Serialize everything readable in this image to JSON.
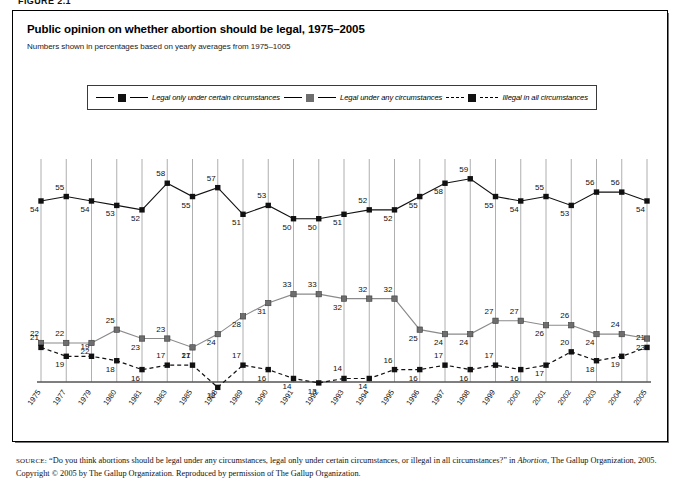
{
  "figure_tag": "FIGURE 2.1",
  "title": "Public opinion on whether abortion should be legal, 1975–2005",
  "subtitle": "Numbers shown in percentages based on yearly averages from 1975–1005",
  "legend": {
    "items": [
      {
        "label": "Legal only under certain circumstances",
        "marker": "dark-square-marker",
        "line": "solid",
        "color": "#111111"
      },
      {
        "label": "Legal under any circumstances",
        "marker": "gray-square-marker",
        "line": "solid",
        "color": "#6e6e6e"
      },
      {
        "label": "Illegal in all circumstances",
        "marker": "dark-square-marker",
        "line": "dashed",
        "color": "#111111"
      }
    ]
  },
  "source": {
    "label": "SOURCE:",
    "line1": "“Do you think abortions should be legal under any circumstances, legal only under certain circumstances, or illegal in all circumstances?” in",
    "italic": "Abortion",
    "line2": ", The Gallup Organization, 2005. Copyright © 2005 by The Gallup Organization. Reproduced by permission of The Gallup Organization."
  },
  "chart_data": {
    "type": "line",
    "title": "Public opinion on whether abortion should be legal, 1975–2005",
    "subtitle": "Numbers shown in percentages based on yearly averages from 1975–1005",
    "xlabel": "",
    "ylabel": "",
    "ylim": [
      0,
      65
    ],
    "grid": "vertical",
    "legend_position": "top",
    "categories": [
      "1975",
      "1977",
      "1979",
      "1980",
      "1981",
      "1983",
      "1985",
      "1988",
      "1989",
      "1990",
      "1991",
      "1992",
      "1993",
      "1994",
      "1995",
      "1996",
      "1997",
      "1998",
      "1999",
      "2000",
      "2001",
      "2002",
      "2003",
      "2004",
      "2005"
    ],
    "series": [
      {
        "name": "Legal only under certain circumstances",
        "color": "#111111",
        "style": "solid",
        "values": [
          54,
          55,
          54,
          53,
          52,
          58,
          55,
          57,
          51,
          53,
          50,
          50,
          51,
          52,
          52,
          55,
          58,
          59,
          55,
          54,
          55,
          53,
          56,
          56,
          54
        ]
      },
      {
        "name": "Legal under any circumstances",
        "color": "#6e6e6e",
        "style": "solid",
        "values": [
          22,
          22,
          22,
          25,
          23,
          23,
          21,
          24,
          28,
          31,
          33,
          33,
          32,
          32,
          32,
          25,
          24,
          24,
          27,
          27,
          26,
          26,
          24,
          24,
          23
        ]
      },
      {
        "name": "Illegal in all circumstances",
        "color": "#111111",
        "style": "dashed",
        "values": [
          21,
          19,
          19,
          18,
          16,
          17,
          17,
          12,
          17,
          16,
          14,
          13,
          14,
          14,
          16,
          16,
          17,
          16,
          17,
          16,
          17,
          20,
          18,
          19,
          21
        ]
      }
    ]
  }
}
